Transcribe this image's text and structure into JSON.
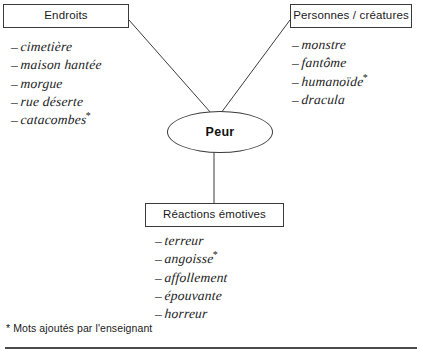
{
  "diagram": {
    "title_node": {
      "label": "Peur"
    },
    "categories": [
      {
        "id": "endroits",
        "label": "Endroits",
        "items": [
          {
            "term": "cimetière",
            "starred": false
          },
          {
            "term": "maison hantée",
            "starred": false
          },
          {
            "term": "morgue",
            "starred": false
          },
          {
            "term": "rue déserte",
            "starred": false
          },
          {
            "term": "catacombes",
            "starred": true
          }
        ]
      },
      {
        "id": "personnes",
        "label": "Personnes / créatures",
        "items": [
          {
            "term": "monstre",
            "starred": false
          },
          {
            "term": "fantôme",
            "starred": false
          },
          {
            "term": "humanoïde",
            "starred": true
          },
          {
            "term": "dracula",
            "starred": false
          }
        ]
      },
      {
        "id": "reactions",
        "label": "Réactions émotives",
        "items": [
          {
            "term": "terreur",
            "starred": false
          },
          {
            "term": "angoisse",
            "starred": true
          },
          {
            "term": "affollement",
            "starred": false
          },
          {
            "term": "épouvante",
            "starred": false
          },
          {
            "term": "horreur",
            "starred": false
          }
        ]
      }
    ],
    "bullet_dash": "–",
    "star_mark": "*",
    "footnote": "* Mots ajoutés par l'enseignant",
    "colors": {
      "ink": "#1a1a1a",
      "stroke": "#3b3b3b",
      "rule": "#4a4a4a",
      "background": "#ffffff"
    }
  }
}
